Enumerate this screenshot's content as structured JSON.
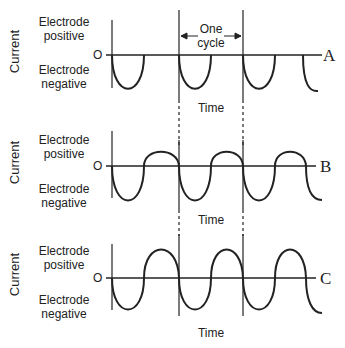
{
  "panels": [
    {
      "id": "A",
      "ylabel": "Current",
      "positive": "Electrode positive",
      "pos1": "Electrode",
      "pos2": "positive",
      "neg1": "Electrode",
      "neg2": "negative",
      "origin": "O",
      "letter": "A",
      "xlabel": "Time",
      "annotation": {
        "line1": "One",
        "line2": "cycle"
      }
    },
    {
      "id": "B",
      "ylabel": "Current",
      "pos1": "Electrode",
      "pos2": "positive",
      "neg1": "Electrode",
      "neg2": "negative",
      "origin": "O",
      "letter": "B",
      "xlabel": "Time"
    },
    {
      "id": "C",
      "ylabel": "Current",
      "pos1": "Electrode",
      "pos2": "positive",
      "neg1": "Electrode",
      "neg2": "negative",
      "origin": "O",
      "letter": "C",
      "xlabel": "Time"
    }
  ]
}
